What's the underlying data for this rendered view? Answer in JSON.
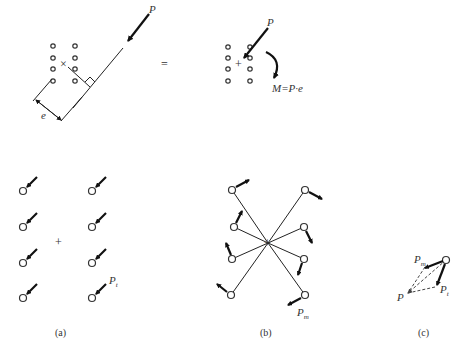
{
  "top": {
    "left_force_label": "P",
    "eccentricity_label": "e",
    "equals": "=",
    "right_force_label": "P",
    "moment_label": "M=P·e"
  },
  "panels": [
    {
      "caption": "(a)",
      "force_label": "P",
      "force_sub": "t",
      "description": "direct shear: equal parallel forces on 8 bolts",
      "centroid": "+"
    },
    {
      "caption": "(b)",
      "force_label": "P",
      "force_sub": "m",
      "description": "torsional shear: forces perpendicular to radius from centroid"
    },
    {
      "caption": "(c)",
      "resultant_label": "P",
      "components": [
        {
          "label": "P",
          "sub": "m"
        },
        {
          "label": "P",
          "sub": "t"
        }
      ],
      "description": "vector sum at critical bolt"
    }
  ],
  "colors": {
    "stroke": "#222222",
    "background": "#ffffff"
  }
}
